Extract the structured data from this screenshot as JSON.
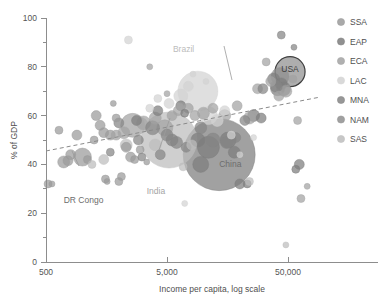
{
  "chart_data": {
    "type": "scatter",
    "title": "",
    "subtitle": "",
    "xlabel": "Income per capita, log scale",
    "ylabel": "% of GDP",
    "xscale": "log",
    "xlim": [
      400,
      130000
    ],
    "ylim": [
      0,
      100
    ],
    "grid": false,
    "x_ticks": [
      {
        "value": 500,
        "label": "500"
      },
      {
        "value": 5000,
        "label": "5,000"
      },
      {
        "value": 50000,
        "label": "50,000"
      }
    ],
    "y_ticks": [
      {
        "value": 0,
        "label": "0"
      },
      {
        "value": 10,
        "label": ""
      },
      {
        "value": 20,
        "label": "20"
      },
      {
        "value": 30,
        "label": ""
      },
      {
        "value": 40,
        "label": "40"
      },
      {
        "value": 50,
        "label": ""
      },
      {
        "value": 60,
        "label": "60"
      },
      {
        "value": 70,
        "label": ""
      },
      {
        "value": 80,
        "label": "80"
      },
      {
        "value": 90,
        "label": ""
      },
      {
        "value": 100,
        "label": "100"
      }
    ],
    "legend_position": "right",
    "legend": [
      {
        "name": "SSA",
        "color": "#9a9a9a"
      },
      {
        "name": "EAP",
        "color": "#7d7d7d"
      },
      {
        "name": "ECA",
        "color": "#a2a2a2"
      },
      {
        "name": "LAC",
        "color": "#d2d2d2"
      },
      {
        "name": "MNA",
        "color": "#858585"
      },
      {
        "name": "NAM",
        "color": "#8f8f8f"
      },
      {
        "name": "SAS",
        "color": "#bdbdbd"
      }
    ],
    "trendline": {
      "style": "dashed",
      "color": "#8a8a8a",
      "x_start": 500,
      "y_start": 45.5,
      "x_end": 90000,
      "y_end": 67.5
    },
    "annotations": [
      {
        "label": "USA",
        "x": 52000,
        "y": 78,
        "color": "#3f3f3f",
        "inside_bubble": true
      },
      {
        "label": "China",
        "x": 13500,
        "y": 39,
        "color": "#6d6d6d",
        "inside_bubble": false
      },
      {
        "label": "India",
        "x": 3400,
        "y": 28,
        "color": "#a4a4a4",
        "inside_bubble": false
      },
      {
        "label": "Brazil",
        "x": 5600,
        "y": 86,
        "color": "#bcbcbc",
        "inside_bubble": false
      },
      {
        "label": "DR Congo",
        "x": 700,
        "y": 24,
        "color": "#6d6d6d",
        "inside_bubble": false
      }
    ],
    "series": [
      {
        "name": "SSA",
        "color": "#9a9a9a",
        "points": [
          {
            "x": 520,
            "y": 32,
            "size": 4
          },
          {
            "x": 560,
            "y": 32,
            "size": 3
          },
          {
            "x": 700,
            "y": 41,
            "size": 6
          },
          {
            "x": 760,
            "y": 41.5,
            "size": 5
          },
          {
            "x": 800,
            "y": 44,
            "size": 5
          },
          {
            "x": 640,
            "y": 54,
            "size": 4
          },
          {
            "x": 1000,
            "y": 43,
            "size": 9
          },
          {
            "x": 1100,
            "y": 42,
            "size": 4
          },
          {
            "x": 1250,
            "y": 50,
            "size": 4
          },
          {
            "x": 1300,
            "y": 60,
            "size": 5
          },
          {
            "x": 1400,
            "y": 56,
            "size": 5
          },
          {
            "x": 1500,
            "y": 53,
            "size": 5
          },
          {
            "x": 1550,
            "y": 34,
            "size": 4
          },
          {
            "x": 1600,
            "y": 33,
            "size": 3
          },
          {
            "x": 1700,
            "y": 52,
            "size": 5
          },
          {
            "x": 1800,
            "y": 65,
            "size": 3
          },
          {
            "x": 1900,
            "y": 59,
            "size": 4
          },
          {
            "x": 2000,
            "y": 33,
            "size": 4
          },
          {
            "x": 2100,
            "y": 35,
            "size": 4
          },
          {
            "x": 2300,
            "y": 47,
            "size": 5
          },
          {
            "x": 2500,
            "y": 43,
            "size": 5
          },
          {
            "x": 2700,
            "y": 42,
            "size": 4
          },
          {
            "x": 3000,
            "y": 46,
            "size": 4
          },
          {
            "x": 3400,
            "y": 41,
            "size": 3
          },
          {
            "x": 900,
            "y": 52,
            "size": 5
          }
        ]
      },
      {
        "name": "EAP",
        "color": "#7d7d7d",
        "points": [
          {
            "x": 13500,
            "y": 44,
            "size": 36
          },
          {
            "x": 11000,
            "y": 47,
            "size": 11
          },
          {
            "x": 9500,
            "y": 40,
            "size": 8
          },
          {
            "x": 16000,
            "y": 50,
            "size": 8
          },
          {
            "x": 18000,
            "y": 45,
            "size": 6
          },
          {
            "x": 20000,
            "y": 32,
            "size": 5
          },
          {
            "x": 23000,
            "y": 32,
            "size": 4
          },
          {
            "x": 26000,
            "y": 60,
            "size": 6
          },
          {
            "x": 30000,
            "y": 59,
            "size": 5
          },
          {
            "x": 38000,
            "y": 75,
            "size": 6
          },
          {
            "x": 41000,
            "y": 71,
            "size": 7
          },
          {
            "x": 44000,
            "y": 73,
            "size": 6
          },
          {
            "x": 6500,
            "y": 64,
            "size": 5
          },
          {
            "x": 7000,
            "y": 61,
            "size": 4
          },
          {
            "x": 4200,
            "y": 62,
            "size": 5
          },
          {
            "x": 2800,
            "y": 58,
            "size": 5
          },
          {
            "x": 5500,
            "y": 50,
            "size": 6
          },
          {
            "x": 9000,
            "y": 50,
            "size": 7
          },
          {
            "x": 62000,
            "y": 40,
            "size": 5
          },
          {
            "x": 58000,
            "y": 38,
            "size": 4
          }
        ]
      },
      {
        "name": "ECA",
        "color": "#a2a2a2",
        "points": [
          {
            "x": 2600,
            "y": 56,
            "size": 12
          },
          {
            "x": 3200,
            "y": 57,
            "size": 7
          },
          {
            "x": 4000,
            "y": 59,
            "size": 6
          },
          {
            "x": 4800,
            "y": 55,
            "size": 8
          },
          {
            "x": 5500,
            "y": 60,
            "size": 5
          },
          {
            "x": 6200,
            "y": 62,
            "size": 5
          },
          {
            "x": 7500,
            "y": 63,
            "size": 5
          },
          {
            "x": 8500,
            "y": 60,
            "size": 5
          },
          {
            "x": 10000,
            "y": 61,
            "size": 6
          },
          {
            "x": 12000,
            "y": 63,
            "size": 5
          },
          {
            "x": 15000,
            "y": 60,
            "size": 6
          },
          {
            "x": 19000,
            "y": 64,
            "size": 5
          },
          {
            "x": 24000,
            "y": 59,
            "size": 6
          },
          {
            "x": 28000,
            "y": 71,
            "size": 5
          },
          {
            "x": 33000,
            "y": 82,
            "size": 4
          },
          {
            "x": 36000,
            "y": 74,
            "size": 5
          },
          {
            "x": 42000,
            "y": 68,
            "size": 5
          },
          {
            "x": 48000,
            "y": 70,
            "size": 6
          },
          {
            "x": 55000,
            "y": 75,
            "size": 4
          },
          {
            "x": 60000,
            "y": 58,
            "size": 4
          },
          {
            "x": 2200,
            "y": 53,
            "size": 6
          },
          {
            "x": 1900,
            "y": 52,
            "size": 5
          },
          {
            "x": 3600,
            "y": 80,
            "size": 3
          },
          {
            "x": 5000,
            "y": 69,
            "size": 3
          },
          {
            "x": 64000,
            "y": 26,
            "size": 4
          },
          {
            "x": 72000,
            "y": 31,
            "size": 3
          }
        ]
      },
      {
        "name": "LAC",
        "color": "#d2d2d2",
        "points": [
          {
            "x": 9000,
            "y": 70,
            "size": 20
          },
          {
            "x": 6500,
            "y": 68,
            "size": 7
          },
          {
            "x": 7500,
            "y": 72,
            "size": 5
          },
          {
            "x": 11000,
            "y": 60,
            "size": 9
          },
          {
            "x": 13000,
            "y": 58,
            "size": 6
          },
          {
            "x": 15000,
            "y": 62,
            "size": 5
          },
          {
            "x": 5200,
            "y": 65,
            "size": 5
          },
          {
            "x": 4200,
            "y": 67,
            "size": 4
          },
          {
            "x": 3600,
            "y": 63,
            "size": 4
          },
          {
            "x": 17000,
            "y": 52,
            "size": 4
          },
          {
            "x": 20000,
            "y": 44,
            "size": 3
          },
          {
            "x": 2400,
            "y": 91,
            "size": 4
          },
          {
            "x": 8200,
            "y": 77,
            "size": 3
          },
          {
            "x": 10500,
            "y": 74,
            "size": 3
          },
          {
            "x": 26000,
            "y": 51,
            "size": 3
          },
          {
            "x": 7000,
            "y": 24,
            "size": 3
          }
        ]
      },
      {
        "name": "MNA",
        "color": "#858585",
        "points": [
          {
            "x": 3800,
            "y": 55,
            "size": 7
          },
          {
            "x": 5000,
            "y": 52,
            "size": 6
          },
          {
            "x": 6000,
            "y": 49,
            "size": 6
          },
          {
            "x": 7200,
            "y": 47,
            "size": 5
          },
          {
            "x": 9500,
            "y": 55,
            "size": 6
          },
          {
            "x": 12000,
            "y": 50,
            "size": 7
          },
          {
            "x": 15500,
            "y": 49,
            "size": 6
          },
          {
            "x": 18500,
            "y": 51,
            "size": 5
          },
          {
            "x": 22000,
            "y": 58,
            "size": 5
          },
          {
            "x": 31000,
            "y": 71,
            "size": 5
          },
          {
            "x": 40000,
            "y": 72,
            "size": 6
          },
          {
            "x": 46000,
            "y": 71,
            "size": 7
          },
          {
            "x": 2000,
            "y": 57,
            "size": 5
          },
          {
            "x": 2900,
            "y": 50,
            "size": 5
          },
          {
            "x": 1700,
            "y": 45,
            "size": 4
          },
          {
            "x": 4400,
            "y": 44,
            "size": 5
          },
          {
            "x": 3100,
            "y": 43,
            "size": 4
          },
          {
            "x": 44000,
            "y": 93,
            "size": 4
          },
          {
            "x": 56000,
            "y": 88,
            "size": 3
          }
        ]
      },
      {
        "name": "NAM",
        "color": "#8f8f8f",
        "points": [
          {
            "x": 52000,
            "y": 78,
            "size": 15
          },
          {
            "x": 43000,
            "y": 76,
            "size": 9
          }
        ]
      },
      {
        "name": "SAS",
        "color": "#bdbdbd",
        "points": [
          {
            "x": 5200,
            "y": 50,
            "size": 28
          },
          {
            "x": 3000,
            "y": 56,
            "size": 8
          },
          {
            "x": 2300,
            "y": 48,
            "size": 6
          },
          {
            "x": 4000,
            "y": 48,
            "size": 6
          },
          {
            "x": 1500,
            "y": 42,
            "size": 5
          },
          {
            "x": 8000,
            "y": 48,
            "size": 5
          },
          {
            "x": 1200,
            "y": 40,
            "size": 4
          },
          {
            "x": 6800,
            "y": 39,
            "size": 4
          },
          {
            "x": 48000,
            "y": 7,
            "size": 3
          },
          {
            "x": 24000,
            "y": 33,
            "size": 4
          }
        ]
      }
    ]
  },
  "axes": {
    "x_title": "Income per capita, log scale",
    "y_title": "% of GDP"
  }
}
